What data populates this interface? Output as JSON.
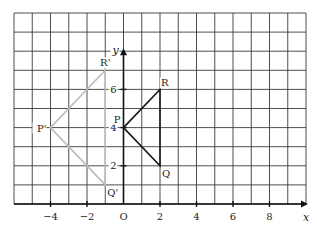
{
  "chart_data": {
    "type": "diagram",
    "title": "",
    "xlabel": "x",
    "ylabel": "y",
    "origin_label": "O",
    "xlim": [
      -6,
      10
    ],
    "ylim": [
      0,
      10
    ],
    "grid": true,
    "x_ticks": [
      -4,
      -2,
      2,
      4,
      6,
      8
    ],
    "y_ticks": [
      2,
      4,
      6
    ],
    "shapes": [
      {
        "name": "PQR",
        "color": "#1a1a1a",
        "points": [
          {
            "label": "P",
            "x": 0,
            "y": 4
          },
          {
            "label": "Q",
            "x": 2,
            "y": 2
          },
          {
            "label": "R",
            "x": 2,
            "y": 6
          }
        ]
      },
      {
        "name": "P'Q'R'",
        "color": "#bdbdbd",
        "points": [
          {
            "label": "P'",
            "x": -4,
            "y": 4
          },
          {
            "label": "Q'",
            "x": -1,
            "y": 1
          },
          {
            "label": "R'",
            "x": -1,
            "y": 7
          }
        ]
      }
    ]
  },
  "colors": {
    "grid": "#3a3a3a",
    "axis": "#111111",
    "background": "#ffffff"
  }
}
